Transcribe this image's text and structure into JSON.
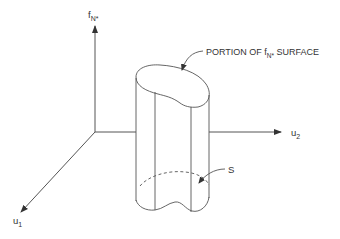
{
  "diagram": {
    "axes": {
      "vertical": {
        "label": "f",
        "subscript": "N*"
      },
      "horizontal": {
        "label": "u",
        "subscript": "2"
      },
      "diagonal": {
        "label": "u",
        "subscript": "1"
      }
    },
    "annotations": {
      "surface_label_prefix": "PORTION OF f",
      "surface_label_subscript": "N*",
      "surface_label_suffix": " SURFACE",
      "region_label": "S"
    },
    "colors": {
      "line": "#555555",
      "text": "#333333",
      "background": "#ffffff"
    }
  }
}
